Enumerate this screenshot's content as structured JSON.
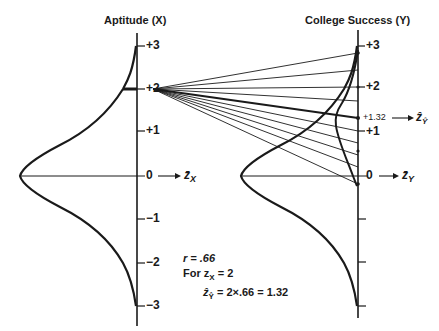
{
  "left_panel": {
    "title": "Aptitude (X)",
    "ticks": [
      {
        "label": "+3",
        "value": 3,
        "y": 46
      },
      {
        "label": "+2",
        "value": 2,
        "y": 89
      },
      {
        "label": "+1",
        "value": 1,
        "y": 131
      },
      {
        "label": "0",
        "value": 0,
        "y": 176
      },
      {
        "label": "−1",
        "value": -1,
        "y": 219
      },
      {
        "label": "−2",
        "value": -2,
        "y": 263
      },
      {
        "label": "−3",
        "value": -3,
        "y": 306
      }
    ],
    "mean_label": "z̄",
    "mean_sub": "X"
  },
  "right_panel": {
    "title": "College Success (Y)",
    "ticks": [
      {
        "label": "+3",
        "value": 3,
        "y": 46
      },
      {
        "label": "+2",
        "value": 2,
        "y": 87
      },
      {
        "label": "+1.32",
        "value": 1.32,
        "y": 118
      },
      {
        "label": "+1",
        "value": 1,
        "y": 131
      },
      {
        "label": "0",
        "value": 0,
        "y": 176
      },
      {
        "label": "",
        "value": -1,
        "y": 219
      },
      {
        "label": "",
        "value": -2,
        "y": 262
      },
      {
        "label": "",
        "value": -3,
        "y": 306
      }
    ],
    "mean_label": "z̄",
    "mean_sub": "Y",
    "predicted_label": "ẑ",
    "predicted_sub": "Ŷ"
  },
  "annotation": {
    "line1": "r = .66",
    "line2_prefix": "For z",
    "line2_sub": "X",
    "line2_suffix": " = 2",
    "line3_prefix": "ẑ",
    "line3_sub": "Ŷ",
    "line3_suffix": " = 2×.66 = 1.32"
  },
  "fan": {
    "origin_z": 2,
    "target_z_values": [
      2.85,
      2.4,
      2.0,
      1.6,
      1.32,
      1.05,
      0.75,
      0.45,
      0.2,
      -0.2
    ],
    "highlight_z": 1.32
  }
}
